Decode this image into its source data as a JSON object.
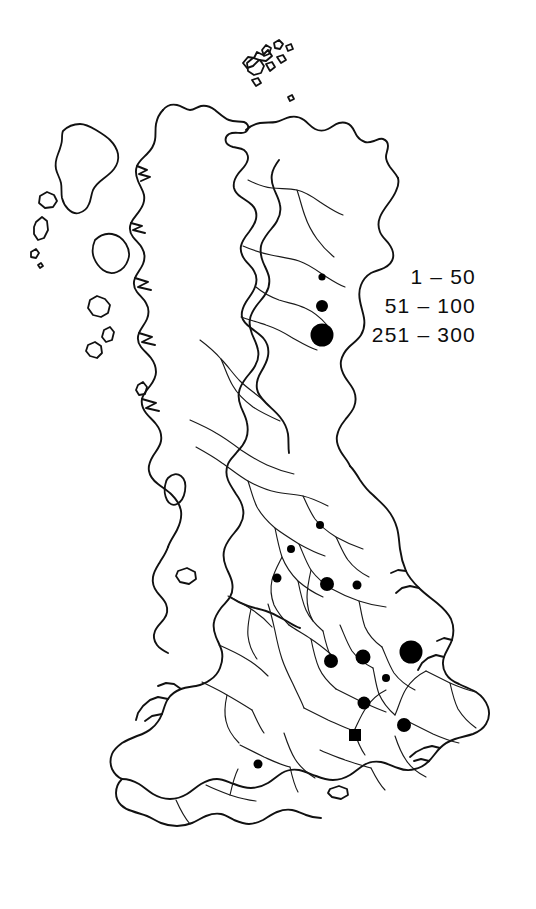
{
  "figure": {
    "type": "choropleth-proportional-symbol-map",
    "region": "Great Britain",
    "width": 536,
    "height": 909,
    "ink_color": "#111111",
    "background_color": "#ffffff"
  },
  "legend": {
    "title": "",
    "position": "upper-right",
    "entries": [
      {
        "label": "1 – 50",
        "symbol": "small-circle",
        "diameter_px": 7,
        "range_min": 1,
        "range_max": 50
      },
      {
        "label": "51 – 100",
        "symbol": "medium-circle",
        "diameter_px": 12,
        "range_min": 51,
        "range_max": 100
      },
      {
        "label": "251 – 300",
        "symbol": "large-circle",
        "diameter_px": 23,
        "range_min": 251,
        "range_max": 300
      }
    ]
  },
  "chart_data": {
    "type": "scatter",
    "title": "",
    "xlabel": "",
    "ylabel": "",
    "classes": [
      "1 – 50",
      "51 – 100",
      "251 – 300"
    ],
    "points": [
      {
        "x": 320,
        "y": 525,
        "size": 8,
        "class": "1 – 50",
        "shape": "circle"
      },
      {
        "x": 291,
        "y": 549,
        "size": 8,
        "class": "1 – 50",
        "shape": "circle"
      },
      {
        "x": 277,
        "y": 578,
        "size": 9,
        "class": "1 – 50",
        "shape": "circle"
      },
      {
        "x": 327,
        "y": 584,
        "size": 14,
        "class": "51 – 100",
        "shape": "circle"
      },
      {
        "x": 357,
        "y": 585,
        "size": 9,
        "class": "1 – 50",
        "shape": "circle"
      },
      {
        "x": 331,
        "y": 661,
        "size": 14,
        "class": "51 – 100",
        "shape": "circle"
      },
      {
        "x": 363,
        "y": 657,
        "size": 15,
        "class": "51 – 100",
        "shape": "circle"
      },
      {
        "x": 411,
        "y": 652,
        "size": 23,
        "class": "251 – 300",
        "shape": "circle"
      },
      {
        "x": 386,
        "y": 678,
        "size": 8,
        "class": "1 – 50",
        "shape": "circle"
      },
      {
        "x": 364,
        "y": 703,
        "size": 13,
        "class": "51 – 100",
        "shape": "circle"
      },
      {
        "x": 355,
        "y": 735,
        "size": 12,
        "class": "51 – 100",
        "shape": "square"
      },
      {
        "x": 404,
        "y": 725,
        "size": 14,
        "class": "51 – 100",
        "shape": "circle"
      },
      {
        "x": 258,
        "y": 764,
        "size": 9,
        "class": "1 – 50",
        "shape": "circle"
      }
    ]
  }
}
